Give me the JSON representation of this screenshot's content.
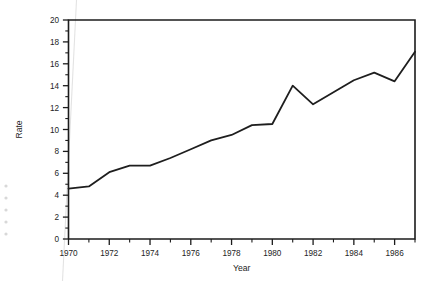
{
  "chart_data": {
    "type": "line",
    "title": "",
    "xlabel": "Year",
    "ylabel": "Rate",
    "xlim": [
      1970,
      1987
    ],
    "ylim": [
      0,
      20
    ],
    "grid": false,
    "legend": null,
    "x_major_ticks": [
      1970,
      1972,
      1974,
      1976,
      1978,
      1980,
      1982,
      1984,
      1986
    ],
    "x_minor_ticks": [
      1971,
      1973,
      1975,
      1977,
      1979,
      1981,
      1983,
      1985,
      1987
    ],
    "x_tick_labels": [
      "1970",
      "1972",
      "1974",
      "1976",
      "1978",
      "1980",
      "1982",
      "1984",
      "1986"
    ],
    "y_major_ticks": [
      0,
      2,
      4,
      6,
      8,
      10,
      12,
      14,
      16,
      18,
      20
    ],
    "y_minor_ticks": [
      1,
      3,
      5,
      7,
      9,
      11,
      13,
      15,
      17,
      19
    ],
    "y_tick_labels": [
      "0",
      "2",
      "4",
      "6",
      "8",
      "10",
      "12",
      "14",
      "16",
      "18",
      "20"
    ],
    "series": [
      {
        "name": "Rate",
        "color": "#1e1e1e",
        "x": [
          1970,
          1971,
          1972,
          1973,
          1974,
          1975,
          1976,
          1977,
          1978,
          1979,
          1980,
          1981,
          1982,
          1983,
          1984,
          1985,
          1986,
          1987
        ],
        "values": [
          4.6,
          4.8,
          6.1,
          6.7,
          6.7,
          7.4,
          8.2,
          9.0,
          9.5,
          10.4,
          10.5,
          14.0,
          12.3,
          13.4,
          14.5,
          15.2,
          14.4,
          17.1
        ]
      }
    ]
  },
  "axes": {
    "x_title": "Year",
    "y_title": "Rate"
  }
}
